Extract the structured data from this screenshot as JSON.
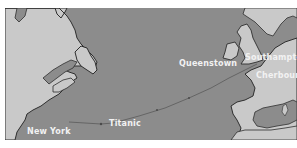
{
  "map": {
    "title": "Titanic route across the North Atlantic",
    "colors": {
      "water": "#8c8c8c",
      "land": "#c9c9c9",
      "coast": "#2e2e2e",
      "route": "#5a5a5a",
      "label": "#f2f2f2"
    },
    "labels": {
      "new_york": "New York",
      "titanic": "Titanic",
      "queenstown": "Queenstown",
      "southampton": "Southampton",
      "cherbourg": "Cherbourg"
    },
    "route": {
      "points": [
        "Southampton",
        "Cherbourg",
        "Queenstown",
        "Titanic (sinking site)",
        "New York"
      ]
    }
  }
}
